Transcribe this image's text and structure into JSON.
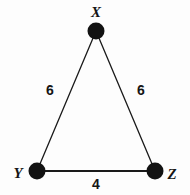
{
  "figure": {
    "kind": "geometry-diagram",
    "shape": "triangle",
    "background_color": "#fdfdfd",
    "stroke_color": "#1a1a1a",
    "vertex_fill_color": "#121212",
    "label_color": "#151515"
  },
  "vertices": [
    {
      "id": "X",
      "label": "X",
      "x": 96,
      "y": 31,
      "dot_radius": 8.5
    },
    {
      "id": "Y",
      "label": "Y",
      "x": 37,
      "y": 171,
      "dot_radius": 8.5
    },
    {
      "id": "Z",
      "label": "Z",
      "x": 155,
      "y": 171,
      "dot_radius": 8.5
    }
  ],
  "edges": [
    {
      "id": "XY",
      "from": "X",
      "to": "Y",
      "label": "6",
      "stroke_width": 1.3
    },
    {
      "id": "XZ",
      "from": "X",
      "to": "Z",
      "label": "6",
      "stroke_width": 1.3
    },
    {
      "id": "YZ",
      "from": "Y",
      "to": "Z",
      "label": "4",
      "stroke_width": 1.8
    }
  ]
}
